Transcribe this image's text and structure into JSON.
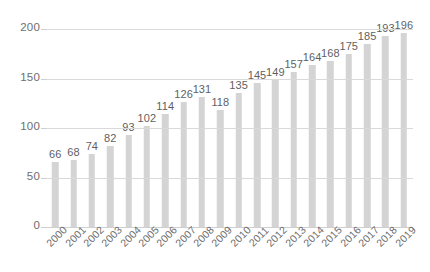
{
  "chart_data": {
    "type": "bar",
    "title": "",
    "subtitle": "",
    "xlabel": "",
    "ylabel": "",
    "categories": [
      "2000",
      "2001",
      "2002",
      "2003",
      "2004",
      "2005",
      "2006",
      "2007",
      "2008",
      "2009",
      "2010",
      "2011",
      "2012",
      "2013",
      "2014",
      "2015",
      "2016",
      "2017",
      "2018",
      "2019"
    ],
    "values": [
      66,
      68,
      74,
      82,
      93,
      102,
      114,
      126,
      131,
      118,
      135,
      145,
      149,
      157,
      164,
      168,
      175,
      185,
      193,
      196
    ],
    "data_labels": [
      "66",
      "68",
      "74",
      "82",
      "93",
      "102",
      "114",
      "126",
      "131",
      "118",
      "135",
      "145",
      "149",
      "157",
      "164",
      "168",
      "175",
      "185",
      "193",
      "196"
    ],
    "ylim": [
      0,
      200
    ],
    "y_ticks": [
      0,
      50,
      100,
      150,
      200
    ],
    "y_tick_labels": [
      "0",
      "50",
      "100",
      "150",
      "200"
    ],
    "grid": true,
    "legend": false,
    "legend_position": "none",
    "annotations": [],
    "x_tick_rotation": -45,
    "bar_color": "#d4d4d4",
    "gridline_color": "#d9d9d9",
    "label_color": "#5f5f5f",
    "tick_color": "#6e6e6e",
    "background_color": "#ffffff"
  }
}
